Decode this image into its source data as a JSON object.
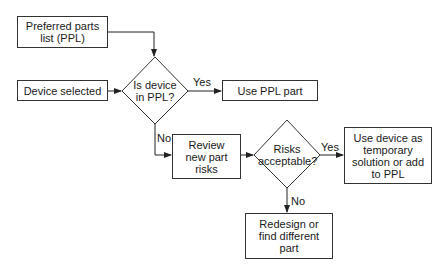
{
  "nodes": {
    "ppl_list": "Preferred parts list (PPL)",
    "device_selected": "Device selected",
    "decision_in_ppl": "Is device in PPL?",
    "use_ppl_part": "Use PPL part",
    "review_risks": "Review new part risks",
    "decision_risks": "Risks acceptable?",
    "use_temporary": "Use device as temporary solution or add to PPL",
    "redesign": "Redesign or find different part"
  },
  "edges": {
    "in_ppl_yes": "Yes",
    "in_ppl_no": "No",
    "risks_yes": "Yes",
    "risks_no": "No"
  },
  "colors": {
    "line": "#333333",
    "background": "#ffffff"
  }
}
